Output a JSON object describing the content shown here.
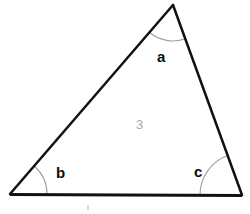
{
  "figure": {
    "kind": "triangle-angle-diagram",
    "background_color": "#ffffff",
    "width": 250,
    "height": 214
  },
  "triangle": {
    "stroke_color": "#111111",
    "side_stroke_width": 2.5,
    "base_stroke_width": 3.2,
    "fill": "none",
    "vertices": {
      "apex": {
        "x": 173,
        "y": 5
      },
      "bottom_left": {
        "x": 10,
        "y": 194
      },
      "bottom_right": {
        "x": 242,
        "y": 195
      }
    }
  },
  "angle_arcs": {
    "stroke_color": "#a0a0a0",
    "stroke_width": 1.1,
    "items": [
      {
        "name": "arc-angle-a",
        "vertex": "apex",
        "radius": 36
      },
      {
        "name": "arc-angle-b",
        "vertex": "bottom_left",
        "radius": 37
      },
      {
        "name": "arc-angle-c",
        "vertex": "bottom_right",
        "radius": 42
      }
    ]
  },
  "labels": {
    "angle_a": "a",
    "angle_b": "b",
    "angle_c": "c",
    "interior": "3"
  },
  "colors": {
    "label_text": "#0d0d0d",
    "interior_text": "#a9a9a9",
    "line": "#111111",
    "arc": "#a0a0a0"
  }
}
